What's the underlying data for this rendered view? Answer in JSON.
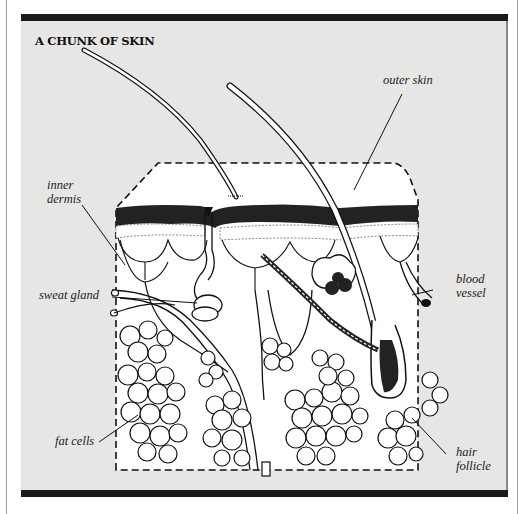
{
  "diagram": {
    "title": "A CHUNK OF SKIN",
    "labels": {
      "outer_skin": "outer skin",
      "inner_dermis_1": "inner",
      "inner_dermis_2": "dermis",
      "sweat_gland": "sweat gland",
      "blood_vessel_1": "blood",
      "blood_vessel_2": "vessel",
      "fat_cells": "fat cells",
      "hair_follicle_1": "hair",
      "hair_follicle_2": "follicle"
    },
    "colors": {
      "panel_background": "#e6e6e4",
      "bars": "#1a1a1a",
      "tissue": "#ffffff",
      "ink": "#111111"
    }
  }
}
